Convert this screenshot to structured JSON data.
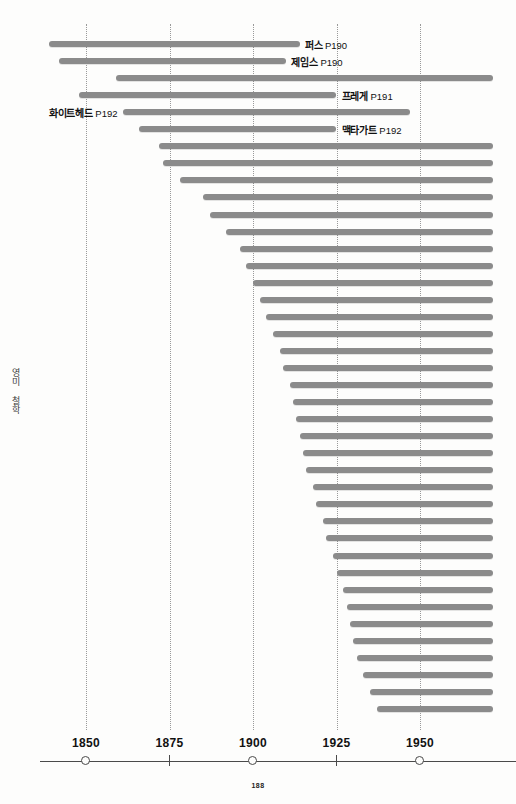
{
  "page": {
    "folio": "188",
    "section_label": "영미 철학",
    "background": "#fdfdfc",
    "bar_color": "#8b8b8b",
    "axis_color": "#4a4a4a",
    "grid_color": "#9a9a9a"
  },
  "chart_data": {
    "type": "bar",
    "orientation": "horizontal",
    "title": "영미 철학",
    "xlabel": "",
    "ylabel": "",
    "xlim": [
      1830,
      1972
    ],
    "grid": true,
    "legend": "none",
    "axis": {
      "ticks": [
        {
          "label": "1850",
          "value": 1850,
          "marker": "circle"
        },
        {
          "label": "1875",
          "value": 1875,
          "marker": "tick"
        },
        {
          "label": "1900",
          "value": 1900,
          "marker": "circle"
        },
        {
          "label": "1925",
          "value": 1925,
          "marker": "tick"
        },
        {
          "label": "1950",
          "value": 1950,
          "marker": "circle"
        }
      ],
      "gridlines": [
        1850,
        1875,
        1900,
        1925,
        1950
      ]
    },
    "bars": [
      {
        "name": "퍼스",
        "page": "P190",
        "label_side": "right",
        "start": 1839,
        "end": 1914
      },
      {
        "name": "제임스",
        "page": "P190",
        "label_side": "right",
        "start": 1842,
        "end": 1910
      },
      {
        "name": "",
        "page": "",
        "label_side": "none",
        "start": 1859,
        "end": 1972
      },
      {
        "name": "프레게",
        "page": "P191",
        "label_side": "right",
        "start": 1848,
        "end": 1925
      },
      {
        "name": "화이트헤드",
        "page": "P192",
        "label_side": "left",
        "start": 1861,
        "end": 1947
      },
      {
        "name": "맥타가트",
        "page": "P192",
        "label_side": "right",
        "start": 1866,
        "end": 1925
      },
      {
        "name": "",
        "page": "",
        "label_side": "none",
        "start": 1872,
        "end": 1972
      },
      {
        "name": "",
        "page": "",
        "label_side": "none",
        "start": 1873,
        "end": 1972
      },
      {
        "name": "",
        "page": "",
        "label_side": "none",
        "start": 1878,
        "end": 1972
      },
      {
        "name": "",
        "page": "",
        "label_side": "none",
        "start": 1885,
        "end": 1972
      },
      {
        "name": "",
        "page": "",
        "label_side": "none",
        "start": 1887,
        "end": 1972
      },
      {
        "name": "",
        "page": "",
        "label_side": "none",
        "start": 1892,
        "end": 1972
      },
      {
        "name": "",
        "page": "",
        "label_side": "none",
        "start": 1896,
        "end": 1972
      },
      {
        "name": "",
        "page": "",
        "label_side": "none",
        "start": 1898,
        "end": 1972
      },
      {
        "name": "",
        "page": "",
        "label_side": "none",
        "start": 1900,
        "end": 1972
      },
      {
        "name": "",
        "page": "",
        "label_side": "none",
        "start": 1902,
        "end": 1972
      },
      {
        "name": "",
        "page": "",
        "label_side": "none",
        "start": 1904,
        "end": 1972
      },
      {
        "name": "",
        "page": "",
        "label_side": "none",
        "start": 1906,
        "end": 1972
      },
      {
        "name": "",
        "page": "",
        "label_side": "none",
        "start": 1908,
        "end": 1972
      },
      {
        "name": "",
        "page": "",
        "label_side": "none",
        "start": 1909,
        "end": 1972
      },
      {
        "name": "",
        "page": "",
        "label_side": "none",
        "start": 1911,
        "end": 1972
      },
      {
        "name": "",
        "page": "",
        "label_side": "none",
        "start": 1912,
        "end": 1972
      },
      {
        "name": "",
        "page": "",
        "label_side": "none",
        "start": 1913,
        "end": 1972
      },
      {
        "name": "",
        "page": "",
        "label_side": "none",
        "start": 1914,
        "end": 1972
      },
      {
        "name": "",
        "page": "",
        "label_side": "none",
        "start": 1915,
        "end": 1972
      },
      {
        "name": "",
        "page": "",
        "label_side": "none",
        "start": 1916,
        "end": 1972
      },
      {
        "name": "",
        "page": "",
        "label_side": "none",
        "start": 1918,
        "end": 1972
      },
      {
        "name": "",
        "page": "",
        "label_side": "none",
        "start": 1919,
        "end": 1972
      },
      {
        "name": "",
        "page": "",
        "label_side": "none",
        "start": 1921,
        "end": 1972
      },
      {
        "name": "",
        "page": "",
        "label_side": "none",
        "start": 1922,
        "end": 1972
      },
      {
        "name": "",
        "page": "",
        "label_side": "none",
        "start": 1924,
        "end": 1972
      },
      {
        "name": "",
        "page": "",
        "label_side": "none",
        "start": 1925,
        "end": 1972
      },
      {
        "name": "",
        "page": "",
        "label_side": "none",
        "start": 1927,
        "end": 1972
      },
      {
        "name": "",
        "page": "",
        "label_side": "none",
        "start": 1928,
        "end": 1972
      },
      {
        "name": "",
        "page": "",
        "label_side": "none",
        "start": 1929,
        "end": 1972
      },
      {
        "name": "",
        "page": "",
        "label_side": "none",
        "start": 1930,
        "end": 1972
      },
      {
        "name": "",
        "page": "",
        "label_side": "none",
        "start": 1931,
        "end": 1972
      },
      {
        "name": "",
        "page": "",
        "label_side": "none",
        "start": 1933,
        "end": 1972
      },
      {
        "name": "",
        "page": "",
        "label_side": "none",
        "start": 1935,
        "end": 1972
      },
      {
        "name": "",
        "page": "",
        "label_side": "none",
        "start": 1937,
        "end": 1972
      }
    ]
  }
}
